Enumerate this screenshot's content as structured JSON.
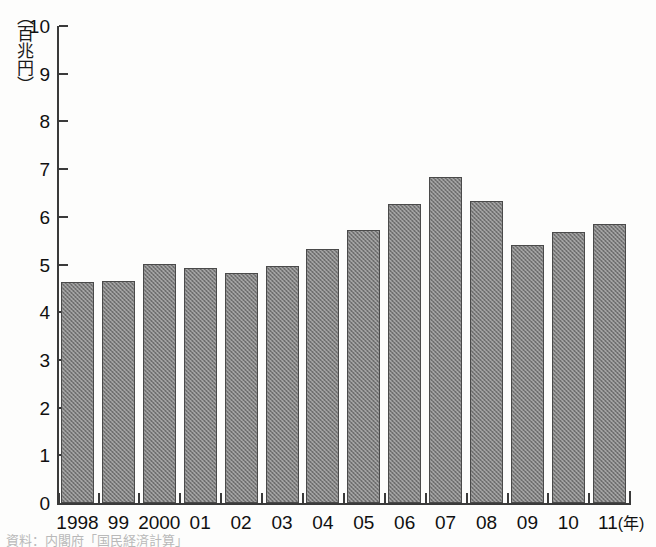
{
  "chart_data": {
    "type": "bar",
    "title": "",
    "subtitle": "",
    "ylabel": "（百兆円）",
    "xlabel": "(年)",
    "categories": [
      "1998",
      "99",
      "2000",
      "01",
      "02",
      "03",
      "04",
      "05",
      "06",
      "07",
      "08",
      "09",
      "10",
      "11"
    ],
    "values": [
      4.63,
      4.65,
      5.02,
      4.93,
      4.83,
      4.97,
      5.33,
      5.72,
      6.26,
      6.84,
      6.34,
      5.41,
      5.69,
      5.84
    ],
    "ylim": [
      0,
      10
    ],
    "yticks": [
      0,
      1,
      2,
      3,
      4,
      5,
      6,
      7,
      8,
      9,
      10
    ],
    "ytick_labels": [
      "0",
      "1",
      "2",
      "3",
      "4",
      "5",
      "6",
      "7",
      "8",
      "9",
      "10"
    ],
    "grid": false,
    "legend": null,
    "series": [
      {
        "name": "",
        "values": [
          4.63,
          4.65,
          5.02,
          4.93,
          4.83,
          4.97,
          5.33,
          5.72,
          6.26,
          6.84,
          6.34,
          5.41,
          5.69,
          5.84
        ]
      }
    ],
    "bar_color": "#7c7c7c",
    "bar_border_color": "#4a4a4a",
    "axis_color": "#3a3a3a"
  },
  "axis": {
    "y_unit_label": "（百兆円）",
    "x_unit_label": "(年)"
  },
  "footnote": {
    "text": "資料：内閣府「国民経済計算」"
  }
}
